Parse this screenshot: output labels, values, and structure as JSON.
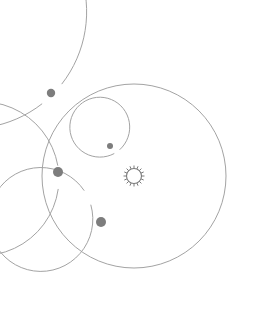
{
  "diagram": {
    "kind": "orrery-solar-system-diagram",
    "canvas": {
      "width": 278,
      "height": 314,
      "background": "#ffffff"
    },
    "center": {
      "x": 134,
      "y": 176
    },
    "colors": {
      "orbit_stroke": "#a3a3a3",
      "orbit_stroke_faint": "#b4b4b4",
      "planet_fill": "#7d7d7d",
      "sun_stroke": "#7a7a7a",
      "background": "#ffffff"
    },
    "sun": {
      "label": "sun",
      "cx": 134,
      "cy": 176,
      "radius": 7.5,
      "ray_count": 16,
      "ray_length": 2.6,
      "stroke_width": 1.1
    },
    "orbits": [
      {
        "name": "orbit-1",
        "radius": 30,
        "stroke_width": 1.0,
        "gap_start_deg": 118,
        "gap_end_deg": 132
      },
      {
        "name": "orbit-2",
        "radius": 52,
        "stroke_width": 1.0,
        "gap_start_deg": 196,
        "gap_end_deg": 214
      },
      {
        "name": "orbit-3",
        "radius": 77,
        "stroke_width": 1.0,
        "gap_start_deg": 172,
        "gap_end_deg": 190
      },
      {
        "name": "orbit-4",
        "radius": 92,
        "stroke_width": 1.0,
        "gap_start_deg": 0,
        "gap_end_deg": 0
      },
      {
        "name": "orbit-5",
        "radius": 117,
        "stroke_width": 1.0,
        "gap_start_deg": 128,
        "gap_end_deg": 142
      }
    ],
    "planets": [
      {
        "name": "planet-outer",
        "orbit": 5,
        "angle_deg": 135,
        "cx": 51,
        "cy": 93,
        "radius": 4.2
      },
      {
        "name": "planet-left",
        "orbit": 3,
        "angle_deg": 181,
        "cx": 58,
        "cy": 172,
        "radius": 5.0
      },
      {
        "name": "planet-lower",
        "orbit": 2,
        "angle_deg": 205,
        "cx": 101,
        "cy": 222,
        "radius": 5.0
      },
      {
        "name": "planet-inner",
        "orbit": 1,
        "angle_deg": 125,
        "cx": 110,
        "cy": 146,
        "radius": 3.0
      }
    ]
  }
}
